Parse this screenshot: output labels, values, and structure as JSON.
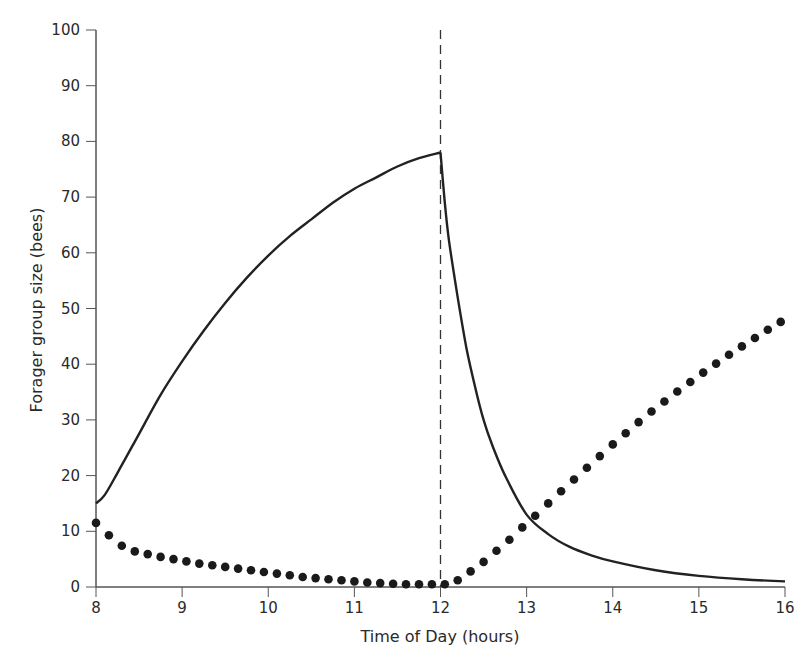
{
  "chart_data": {
    "type": "line",
    "title": "",
    "xlabel": "Time of Day (hours)",
    "ylabel": "Forager group size (bees)",
    "xlim": [
      8,
      16
    ],
    "ylim": [
      0,
      100
    ],
    "x_ticks": [
      8,
      9,
      10,
      11,
      12,
      13,
      14,
      15,
      16
    ],
    "y_ticks": [
      0,
      10,
      20,
      30,
      40,
      50,
      60,
      70,
      80,
      90,
      100
    ],
    "grid": false,
    "legend": null,
    "annotations": [
      {
        "type": "vertical-dashed-line",
        "x": 12
      }
    ],
    "series": [
      {
        "name": "solid-line",
        "style": "solid",
        "x": [
          8.0,
          8.1,
          8.25,
          8.5,
          8.75,
          9.0,
          9.25,
          9.5,
          9.75,
          10.0,
          10.25,
          10.5,
          10.75,
          11.0,
          11.25,
          11.5,
          11.75,
          12.0,
          12.05,
          12.1,
          12.2,
          12.3,
          12.4,
          12.5,
          12.6,
          12.75,
          13.0,
          13.25,
          13.5,
          13.75,
          14.0,
          14.5,
          15.0,
          15.5,
          16.0
        ],
        "y": [
          15.0,
          16.5,
          20.5,
          27.5,
          34.5,
          40.5,
          46.0,
          51.0,
          55.5,
          59.5,
          63.0,
          66.0,
          69.0,
          71.5,
          73.5,
          75.5,
          77.0,
          78.0,
          69.0,
          62.0,
          52.0,
          43.0,
          36.0,
          30.0,
          25.5,
          20.0,
          13.0,
          9.5,
          7.2,
          5.7,
          4.6,
          3.0,
          2.0,
          1.4,
          1.0
        ]
      },
      {
        "name": "dotted-series",
        "style": "dots",
        "x": [
          8.0,
          8.15,
          8.3,
          8.45,
          8.6,
          8.75,
          8.9,
          9.05,
          9.2,
          9.35,
          9.5,
          9.65,
          9.8,
          9.95,
          10.1,
          10.25,
          10.4,
          10.55,
          10.7,
          10.85,
          11.0,
          11.15,
          11.3,
          11.45,
          11.6,
          11.75,
          11.9,
          12.05,
          12.2,
          12.35,
          12.5,
          12.65,
          12.8,
          12.95,
          13.1,
          13.25,
          13.4,
          13.55,
          13.7,
          13.85,
          14.0,
          14.15,
          14.3,
          14.45,
          14.6,
          14.75,
          14.9,
          15.05,
          15.2,
          15.35,
          15.5,
          15.65,
          15.8,
          15.95
        ],
        "y": [
          11.5,
          9.3,
          7.4,
          6.4,
          5.9,
          5.4,
          5.0,
          4.6,
          4.2,
          3.9,
          3.6,
          3.3,
          3.0,
          2.7,
          2.4,
          2.1,
          1.8,
          1.6,
          1.4,
          1.2,
          1.0,
          0.8,
          0.7,
          0.6,
          0.5,
          0.5,
          0.5,
          0.5,
          1.2,
          2.8,
          4.5,
          6.5,
          8.5,
          10.7,
          12.8,
          15.0,
          17.2,
          19.3,
          21.4,
          23.5,
          25.6,
          27.6,
          29.6,
          31.5,
          33.3,
          35.1,
          36.8,
          38.5,
          40.1,
          41.7,
          43.2,
          44.7,
          46.2,
          47.6
        ]
      }
    ]
  },
  "axes": {
    "x_title": "Time of Day (hours)",
    "y_title": "Forager group size (bees)",
    "x_tick_labels": [
      "8",
      "9",
      "10",
      "11",
      "12",
      "13",
      "14",
      "15",
      "16"
    ],
    "y_tick_labels": [
      "0",
      "10",
      "20",
      "30",
      "40",
      "50",
      "60",
      "70",
      "80",
      "90",
      "100"
    ]
  },
  "colors": {
    "line": "#222222",
    "dots": "#1a1a1a",
    "axis": "#555555",
    "dashed": "#333333"
  }
}
